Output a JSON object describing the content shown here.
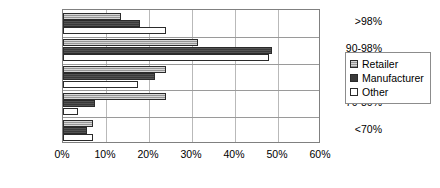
{
  "chart_data": {
    "type": "bar",
    "orientation": "horizontal",
    "title": "",
    "xlabel": "",
    "ylabel": "",
    "categories": [
      ">98%",
      "90-98%",
      "80-90%",
      "70-80%",
      "<70%"
    ],
    "series": [
      {
        "name": "Retailer",
        "values": [
          13.5,
          31.5,
          24.0,
          24.0,
          7.0
        ]
      },
      {
        "name": "Manufacturer",
        "values": [
          18.0,
          48.5,
          21.5,
          7.5,
          5.5
        ]
      },
      {
        "name": "Other",
        "values": [
          24.0,
          48.0,
          17.5,
          3.5,
          7.0
        ]
      }
    ],
    "xlim": [
      0,
      60
    ],
    "xticks": [
      0,
      10,
      20,
      30,
      40,
      50,
      60
    ],
    "xtick_labels": [
      "0%",
      "10%",
      "20%",
      "30%",
      "40%",
      "50%",
      "60%"
    ],
    "grid": "vertical",
    "legend_position": "right",
    "colors": {
      "retailer": "#a6a6a6",
      "manufacturer": "#3a3a3a",
      "other": "#ffffff",
      "bar_outline": "#2b2b2b",
      "gridline": "#b9b9b9",
      "frame": "#808080",
      "text": "#000000",
      "background": "#ffffff"
    }
  },
  "legend": {
    "items": [
      {
        "label": "Retailer"
      },
      {
        "label": "Manufacturer"
      },
      {
        "label": "Other"
      }
    ]
  }
}
